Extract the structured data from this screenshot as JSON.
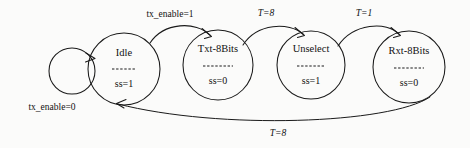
{
  "diagram": {
    "type": "state-machine",
    "background_color": "#fbfbfa",
    "stroke_color": "#1a1a1a",
    "text_color": "#111111",
    "states": [
      {
        "id": "idle",
        "name": "Idle",
        "separator": "----",
        "output": "ss=1",
        "cx": 124,
        "cy": 69,
        "r": 36
      },
      {
        "id": "txt8bits",
        "name": "Txt-8Bits",
        "separator": "------",
        "output": "ss=0",
        "cx": 218,
        "cy": 65,
        "r": 35
      },
      {
        "id": "unselect",
        "name": "Unselect",
        "separator": "------",
        "output": "ss=1",
        "cx": 311,
        "cy": 65,
        "r": 34
      },
      {
        "id": "rxt8bits",
        "name": "Rxt-8Bits",
        "separator": "------",
        "output": "ss=0",
        "cx": 409,
        "cy": 67,
        "r": 36
      }
    ],
    "transitions": [
      {
        "id": "idle-self-loop",
        "from": "idle",
        "to": "idle",
        "label": "tx_enable=0",
        "label_x": 52,
        "label_y": 108,
        "italic": false
      },
      {
        "id": "idle-to-txt8bits",
        "from": "idle",
        "to": "txt8bits",
        "label": "tx_enable=1",
        "label_x": 170,
        "label_y": 15,
        "italic": false
      },
      {
        "id": "txt8bits-to-unselect",
        "from": "txt8bits",
        "to": "unselect",
        "label": "T=8",
        "label_x": 266,
        "label_y": 14,
        "italic": true
      },
      {
        "id": "unselect-to-rxt8bits",
        "from": "unselect",
        "to": "rxt8bits",
        "label": "T=1",
        "label_x": 364,
        "label_y": 14,
        "italic": true
      },
      {
        "id": "rxt8bits-to-idle",
        "from": "rxt8bits",
        "to": "idle",
        "label": "T=8",
        "label_x": 278,
        "label_y": 134,
        "italic": true
      }
    ]
  }
}
